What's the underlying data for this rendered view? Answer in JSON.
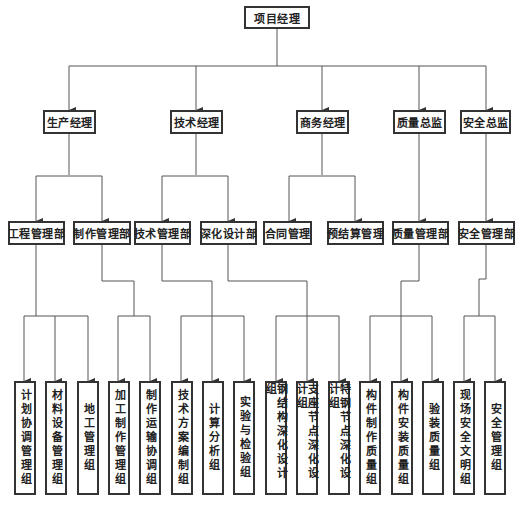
{
  "diagram": {
    "type": "org-chart",
    "root": {
      "label": "项目经理"
    },
    "level2": [
      {
        "label": "生产经理"
      },
      {
        "label": "技术经理"
      },
      {
        "label": "商务经理"
      },
      {
        "label": "质量总监"
      },
      {
        "label": "安全总监"
      }
    ],
    "level3": [
      {
        "label": "工程管理部",
        "parent": "生产经理"
      },
      {
        "label": "制作管理部",
        "parent": "生产经理"
      },
      {
        "label": "技术管理部",
        "parent": "技术经理"
      },
      {
        "label": "深化设计部",
        "parent": "技术经理"
      },
      {
        "label": "合同管理",
        "parent": "商务经理"
      },
      {
        "label": "预结算管理",
        "parent": "商务经理"
      },
      {
        "label": "质量管理部",
        "parent": "质量总监"
      },
      {
        "label": "安全管理部",
        "parent": "安全总监"
      }
    ],
    "level4": [
      {
        "label": "计划协调管理组",
        "parent": "工程管理部"
      },
      {
        "label": "材料设备管理组",
        "parent": "工程管理部"
      },
      {
        "label": "地工管理组",
        "parent": "工程管理部"
      },
      {
        "label": "加工制作管理组",
        "parent": "制作管理部"
      },
      {
        "label": "制作运输协调组",
        "parent": "制作管理部"
      },
      {
        "label": "技术方案编制组",
        "parent": "技术管理部"
      },
      {
        "label": "计算分析组",
        "parent": "技术管理部"
      },
      {
        "label": "实验与检验组",
        "parent": "技术管理部"
      },
      {
        "label": "钢结构深化设计组",
        "parent": "深化设计部"
      },
      {
        "label": "支座节点深化设计组",
        "parent": "深化设计部"
      },
      {
        "label": "特钢节点深化设计组",
        "parent": "深化设计部"
      },
      {
        "label": "构件制作质量组",
        "parent": "质量管理部"
      },
      {
        "label": "构件安装质量组",
        "parent": "质量管理部"
      },
      {
        "label": "验装质量组",
        "parent": "质量管理部"
      },
      {
        "label": "现场安全文明组",
        "parent": "安全管理部"
      },
      {
        "label": "安全管理组",
        "parent": "安全管理部"
      }
    ],
    "colors": {
      "line": "#555555",
      "border": "#333333",
      "background": "#ffffff"
    }
  }
}
